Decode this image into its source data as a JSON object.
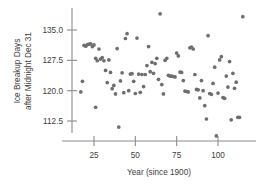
{
  "chart_data": {
    "type": "scatter",
    "title": "",
    "xlabel": "Year (since 1900)",
    "ylabel": "Ice Breakup Days after Midnight Dec 31",
    "ylabel_line1": "Ice Breakup Days",
    "ylabel_line2": "after Midnight Dec 31",
    "xticks": [
      25,
      50,
      75,
      100
    ],
    "xticklabels": [
      "25",
      "50",
      "75",
      "100"
    ],
    "yticks": [
      112.5,
      120.0,
      127.5,
      135.0
    ],
    "yticklabels": [
      "112.5",
      "120.0",
      "127.5",
      "135.0"
    ],
    "xlim": [
      14,
      118
    ],
    "ylim": [
      107.5,
      140.5
    ],
    "grid": false,
    "legend": null,
    "marker": "filled-circle",
    "marker_color": "#6e6e6e",
    "axis_color": "#8c8c8c",
    "points": [
      [
        17,
        119.7
      ],
      [
        18,
        122.3
      ],
      [
        19,
        131.2
      ],
      [
        20,
        131.0
      ],
      [
        21,
        131.4
      ],
      [
        22,
        131.5
      ],
      [
        23,
        131.6
      ],
      [
        24,
        130.9
      ],
      [
        25,
        131.3
      ],
      [
        26,
        128.0
      ],
      [
        26,
        115.9
      ],
      [
        27,
        127.4
      ],
      [
        28,
        130.3
      ],
      [
        29,
        127.8
      ],
      [
        30,
        128.2
      ],
      [
        31,
        127.4
      ],
      [
        32,
        125.0
      ],
      [
        33,
        122.0
      ],
      [
        34,
        127.6
      ],
      [
        35,
        124.5
      ],
      [
        36,
        120.5
      ],
      [
        37,
        121.3
      ],
      [
        38,
        119.2
      ],
      [
        39,
        130.4
      ],
      [
        40,
        111.0
      ],
      [
        41,
        122.4
      ],
      [
        42,
        124.4
      ],
      [
        43,
        119.5
      ],
      [
        44,
        132.9
      ],
      [
        45,
        134.1
      ],
      [
        46,
        120.0
      ],
      [
        47,
        124.1
      ],
      [
        48,
        124.2
      ],
      [
        49,
        122.3
      ],
      [
        50,
        119.3
      ],
      [
        51,
        133.0
      ],
      [
        52,
        124.1
      ],
      [
        53,
        119.6
      ],
      [
        54,
        124.0
      ],
      [
        55,
        121.0
      ],
      [
        56,
        124.0
      ],
      [
        57,
        126.2
      ],
      [
        58,
        130.9
      ],
      [
        59,
        124.7
      ],
      [
        60,
        127.0
      ],
      [
        61,
        124.3
      ],
      [
        62,
        126.7
      ],
      [
        63,
        128.0
      ],
      [
        64,
        122.8
      ],
      [
        65,
        139.0
      ],
      [
        66,
        121.5
      ],
      [
        67,
        119.2
      ],
      [
        68,
        127.5
      ],
      [
        69,
        128.0
      ],
      [
        70,
        123.8
      ],
      [
        71,
        123.6
      ],
      [
        72,
        123.6
      ],
      [
        73,
        123.5
      ],
      [
        74,
        123.4
      ],
      [
        75,
        129.3
      ],
      [
        76,
        128.6
      ],
      [
        77,
        124.6
      ],
      [
        78,
        124.5
      ],
      [
        79,
        122.5
      ],
      [
        80,
        119.9
      ],
      [
        81,
        119.8
      ],
      [
        82,
        119.7
      ],
      [
        83,
        130.6
      ],
      [
        84,
        130.8
      ],
      [
        85,
        130.3
      ],
      [
        86,
        124.0
      ],
      [
        87,
        120.3
      ],
      [
        88,
        120.2
      ],
      [
        89,
        118.2
      ],
      [
        90,
        122.5
      ],
      [
        91,
        120.0
      ],
      [
        92,
        116.3
      ],
      [
        93,
        113.0
      ],
      [
        94,
        133.6
      ],
      [
        95,
        119.3
      ],
      [
        96,
        119.1
      ],
      [
        97,
        121.8
      ],
      [
        98,
        125.8
      ],
      [
        99,
        108.8
      ],
      [
        100,
        119.4
      ],
      [
        101,
        127.6
      ],
      [
        102,
        128.4
      ],
      [
        103,
        118.3
      ],
      [
        104,
        118.1
      ],
      [
        105,
        123.6
      ],
      [
        106,
        120.9
      ],
      [
        107,
        127.2
      ],
      [
        108,
        112.8
      ],
      [
        109,
        124.3
      ],
      [
        110,
        120.6
      ],
      [
        111,
        122.1
      ],
      [
        112,
        113.4
      ],
      [
        113,
        113.4
      ],
      [
        115,
        138.3
      ]
    ]
  }
}
